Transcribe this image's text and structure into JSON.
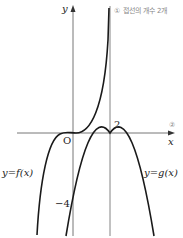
{
  "diagram": {
    "axes": {
      "x_label": "x",
      "y_label": "y",
      "origin_label": "O"
    },
    "ticks": {
      "x_tick": "2",
      "y_tick": "−4"
    },
    "curves": {
      "f_label": "y=f(x)",
      "g_label": "y=g(x)"
    },
    "annotations": {
      "note_1": "① 접선의 개수 2개",
      "note_2": "②"
    },
    "colors": {
      "curve": "#1a1a1a",
      "axis": "#555555",
      "note": "#888888"
    }
  }
}
